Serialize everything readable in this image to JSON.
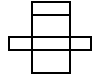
{
  "diagram": {
    "type": "box-net",
    "stroke_color": "#000000",
    "background": "#ffffff",
    "stroke_width": 2,
    "faces": [
      {
        "name": "top-lid-flap",
        "x": 32,
        "y": 2,
        "w": 38,
        "h": 13
      },
      {
        "name": "top-face",
        "x": 32,
        "y": 15,
        "w": 38,
        "h": 22
      },
      {
        "name": "left-side-face",
        "x": 9,
        "y": 37,
        "w": 23,
        "h": 13
      },
      {
        "name": "front-face",
        "x": 32,
        "y": 37,
        "w": 38,
        "h": 13
      },
      {
        "name": "right-side-face",
        "x": 70,
        "y": 37,
        "w": 21,
        "h": 13
      },
      {
        "name": "bottom-face",
        "x": 32,
        "y": 50,
        "w": 38,
        "h": 23
      }
    ]
  }
}
